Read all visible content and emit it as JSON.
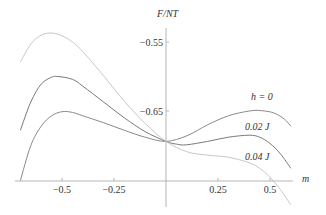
{
  "chart_data": {
    "type": "line",
    "title": "",
    "xlabel": "m",
    "ylabel": "F/NT",
    "xlim": [
      -0.73,
      0.61
    ],
    "ylim": [
      -0.79,
      -0.525
    ],
    "x_axis_crosses_y_at": -0.751,
    "x_ticks": [
      {
        "value": -0.5,
        "label": "−0.5"
      },
      {
        "value": -0.25,
        "label": "−0.25"
      },
      {
        "value": 0.25,
        "label": "0.25"
      },
      {
        "value": 0.5,
        "label": "0.5"
      }
    ],
    "y_ticks": [
      {
        "value": -0.55,
        "label": "−0.55"
      },
      {
        "value": -0.65,
        "label": "−0.65"
      }
    ],
    "grid": false,
    "legend": "inline labels at right end of curves",
    "series": [
      {
        "name": "h = 0",
        "label": "h = 0",
        "color": "#8a8a8a",
        "points": [
          [
            -0.7,
            -0.751
          ],
          [
            -0.65,
            -0.7
          ],
          [
            -0.6,
            -0.672
          ],
          [
            -0.55,
            -0.657
          ],
          [
            -0.5,
            -0.651
          ],
          [
            -0.45,
            -0.652
          ],
          [
            -0.4,
            -0.657
          ],
          [
            -0.3,
            -0.667
          ],
          [
            -0.2,
            -0.678
          ],
          [
            -0.1,
            -0.688
          ],
          [
            0.0,
            -0.694
          ],
          [
            0.1,
            -0.686
          ],
          [
            0.2,
            -0.67
          ],
          [
            0.3,
            -0.657
          ],
          [
            0.4,
            -0.65
          ],
          [
            0.46,
            -0.6495
          ],
          [
            0.52,
            -0.653
          ],
          [
            0.57,
            -0.662
          ],
          [
            0.6,
            -0.672
          ]
        ]
      },
      {
        "name": "0.02 J",
        "label": "0.02 J",
        "color": "#7a7a7a",
        "points": [
          [
            -0.7,
            -0.678
          ],
          [
            -0.65,
            -0.637
          ],
          [
            -0.6,
            -0.611
          ],
          [
            -0.55,
            -0.601
          ],
          [
            -0.52,
            -0.6
          ],
          [
            -0.45,
            -0.604
          ],
          [
            -0.4,
            -0.614
          ],
          [
            -0.3,
            -0.637
          ],
          [
            -0.2,
            -0.66
          ],
          [
            -0.1,
            -0.68
          ],
          [
            0.0,
            -0.694
          ],
          [
            0.05,
            -0.698
          ],
          [
            0.1,
            -0.699
          ],
          [
            0.2,
            -0.694
          ],
          [
            0.3,
            -0.688
          ],
          [
            0.4,
            -0.685
          ],
          [
            0.45,
            -0.688
          ],
          [
            0.5,
            -0.697
          ],
          [
            0.55,
            -0.712
          ],
          [
            0.6,
            -0.733
          ]
        ]
      },
      {
        "name": "0.04 J",
        "label": "0.04 J",
        "color": "#c8c8c8",
        "points": [
          [
            -0.7,
            -0.579
          ],
          [
            -0.65,
            -0.553
          ],
          [
            -0.6,
            -0.54
          ],
          [
            -0.55,
            -0.537
          ],
          [
            -0.5,
            -0.541
          ],
          [
            -0.45,
            -0.55
          ],
          [
            -0.4,
            -0.564
          ],
          [
            -0.3,
            -0.599
          ],
          [
            -0.2,
            -0.636
          ],
          [
            -0.1,
            -0.668
          ],
          [
            0.0,
            -0.694
          ],
          [
            0.1,
            -0.709
          ],
          [
            0.2,
            -0.714
          ],
          [
            0.3,
            -0.717
          ],
          [
            0.4,
            -0.725
          ],
          [
            0.45,
            -0.733
          ],
          [
            0.5,
            -0.746
          ],
          [
            0.55,
            -0.764
          ],
          [
            0.6,
            -0.786
          ]
        ]
      }
    ]
  },
  "labels": {
    "y_axis_title": "F/NT",
    "x_axis_title": "m",
    "curve_h0": "h = 0",
    "curve_002": "0.02 J",
    "curve_004": "0.04 J"
  }
}
